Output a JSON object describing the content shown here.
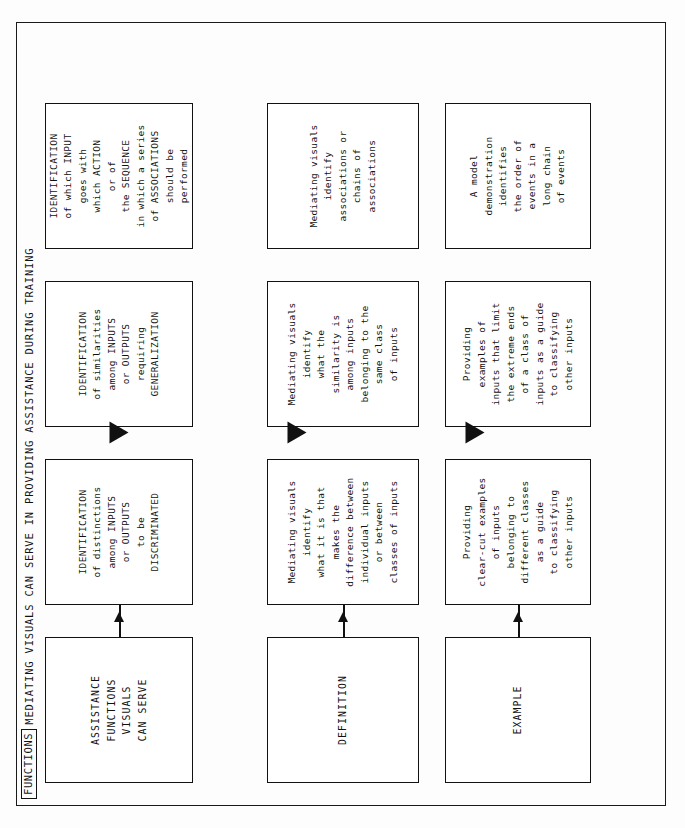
{
  "title": {
    "tag": "FUNCTIONS",
    "text": "MEDIATING VISUALS CAN SERVE IN PROVIDING ASSISTANCE DURING TRAINING"
  },
  "header_column": {
    "boxes": [
      {
        "label": "ASSISTANCE\nFUNCTIONS\nVISUALS\nCAN SERVE"
      },
      {
        "label": "DEFINITION"
      },
      {
        "label": "EXAMPLE"
      }
    ]
  },
  "columns": [
    {
      "function_box": "IDENTIFICATION\nof distinctions\namong INPUTS\nor OUTPUTS\nto be\nDISCRIMINATED",
      "definition_box": "Mediating visuals\nidentify\nwhat it is that\nmakes the\ndifference between\nindividual inputs\nor between\nclasses of inputs",
      "example_box": "Providing\nclear-cut examples\nof inputs\nbelonging to\ndifferent classes\nas a guide\nto classifying\nother inputs"
    },
    {
      "function_box": "IDENTIFICATION\nof similarities\namong INPUTS\nor OUTPUTS\nrequiring\nGENERALIZATION",
      "definition_box": "Mediating visuals\nidentify\nwhat the\nsimilarity is\namong inputs\nbelonging to the\nsame class\nof inputs",
      "example_box": "Providing\nexamples of\ninputs that limit\nthe extreme ends\nof a class of\ninputs as a guide\nto classifying\nother inputs"
    },
    {
      "function_box": "IDENTIFICATION\nof which INPUT\ngoes with\nwhich ACTION\nor of\nthe SEQUENCE\nin which a series\nof ASSOCIATIONS\nshould be\nperformed",
      "definition_box": "Mediating visuals\nidentify\nassociations or\nchains of\nassociations",
      "example_box": "A model\ndemonstration\nidentifies\nthe order of\nevents in a\nlong chain\nof events"
    }
  ],
  "colors": {
    "ink": "#111111",
    "paper": "#ffffff"
  }
}
